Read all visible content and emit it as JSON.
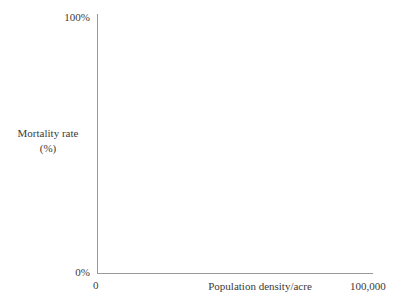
{
  "chart_data": {
    "type": "scatter",
    "title": "",
    "subtitle": "",
    "xlabel": "Population density/acre",
    "ylabel": "Mortality rate",
    "ylabel_units": "(%)",
    "x": [],
    "values": [],
    "series": [],
    "xlim": [
      0,
      100000
    ],
    "ylim": [
      0,
      100
    ],
    "x_tick_labels": [
      "0",
      "100,000"
    ],
    "y_tick_labels": [
      "0%",
      "100%"
    ],
    "grid": false,
    "legend": false,
    "legend_position": "none",
    "annotations": [],
    "note": "empty axes, no data plotted"
  },
  "axes": {
    "y_title_line1": "Mortality rate",
    "y_title_line2": "(%)",
    "x_title": "Population density/acre",
    "y_tick_top": "100%",
    "y_tick_bottom": "0%",
    "x_tick_left": "0",
    "x_tick_right": "100,000"
  },
  "colors": {
    "background": "#ffffff",
    "axis_line": "#9a9a9a",
    "text": "#3a3a3a"
  }
}
